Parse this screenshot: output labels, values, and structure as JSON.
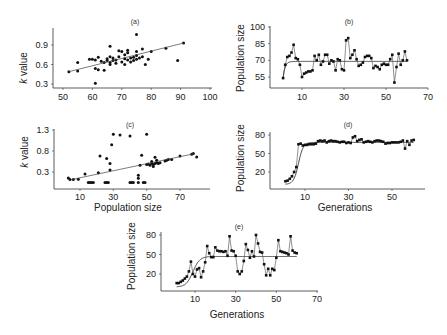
{
  "chart_data": [
    {
      "panel": "(a)",
      "type": "scatter",
      "title": "(a)",
      "xlabel": "",
      "ylabel": "k value",
      "xticks": [
        50,
        60,
        70,
        80,
        90,
        100
      ],
      "yticks": [
        0.3,
        0.6,
        0.9
      ],
      "xlim": [
        50,
        100
      ],
      "ylim": [
        0.25,
        1.1
      ],
      "points": [
        [
          52,
          0.49
        ],
        [
          55,
          0.5
        ],
        [
          55,
          0.63
        ],
        [
          59,
          0.68
        ],
        [
          60,
          0.68
        ],
        [
          61,
          0.67
        ],
        [
          61,
          0.54
        ],
        [
          62,
          0.52
        ],
        [
          61,
          0.31
        ],
        [
          62,
          0.71
        ],
        [
          63,
          0.65
        ],
        [
          64,
          0.51
        ],
        [
          64,
          0.63
        ],
        [
          65,
          0.66
        ],
        [
          65,
          0.69
        ],
        [
          66,
          0.72
        ],
        [
          66,
          0.6
        ],
        [
          66,
          0.63
        ],
        [
          66,
          0.88
        ],
        [
          67,
          0.66
        ],
        [
          67,
          0.7
        ],
        [
          68,
          0.62
        ],
        [
          68,
          0.67
        ],
        [
          69,
          0.72
        ],
        [
          69,
          0.81
        ],
        [
          70,
          0.8
        ],
        [
          70,
          0.64
        ],
        [
          71,
          0.6
        ],
        [
          71,
          0.69
        ],
        [
          71,
          0.75
        ],
        [
          72,
          0.67
        ],
        [
          72,
          0.78
        ],
        [
          72,
          0.82
        ],
        [
          73,
          0.7
        ],
        [
          73,
          0.64
        ],
        [
          74,
          0.66
        ],
        [
          74,
          0.71
        ],
        [
          75,
          0.74
        ],
        [
          75,
          0.68
        ],
        [
          75,
          0.8
        ],
        [
          75,
          1.06
        ],
        [
          76,
          0.7
        ],
        [
          77,
          0.84
        ],
        [
          77,
          0.72
        ],
        [
          78,
          0.6
        ],
        [
          79,
          0.68
        ],
        [
          80,
          0.8
        ],
        [
          85,
          0.85
        ],
        [
          89,
          0.66
        ],
        [
          91,
          0.93
        ]
      ],
      "fit": {
        "type": "linear",
        "from": [
          52,
          0.49
        ],
        "to": [
          91,
          0.93
        ]
      }
    },
    {
      "panel": "(b)",
      "type": "line",
      "title": "(b)",
      "xlabel": "",
      "ylabel": "Population size",
      "xticks": [
        10,
        30,
        50,
        70
      ],
      "yticks": [
        55,
        70,
        85,
        100
      ],
      "xlim": [
        0,
        70
      ],
      "ylim": [
        48,
        100
      ],
      "x": [
        1,
        2,
        3,
        4,
        5,
        6,
        7,
        8,
        9,
        10,
        11,
        12,
        13,
        14,
        15,
        16,
        17,
        18,
        19,
        20,
        21,
        22,
        23,
        24,
        25,
        26,
        27,
        28,
        29,
        30,
        31,
        32,
        33,
        34,
        35,
        36,
        37,
        38,
        39,
        40,
        41,
        42,
        43,
        44,
        45,
        46,
        47,
        48,
        49,
        50,
        51,
        52,
        53,
        54,
        55,
        56,
        57,
        58,
        59,
        60
      ],
      "values": [
        54,
        66,
        73,
        74,
        77,
        84,
        72,
        71,
        66,
        55,
        58,
        59,
        60,
        60,
        61,
        74,
        70,
        75,
        66,
        69,
        75,
        75,
        67,
        70,
        69,
        61,
        71,
        70,
        62,
        61,
        88,
        90,
        72,
        75,
        79,
        71,
        65,
        66,
        68,
        73,
        74,
        74,
        72,
        63,
        65,
        64,
        62,
        66,
        67,
        66,
        66,
        71,
        75,
        50,
        64,
        76,
        66,
        70,
        78,
        70
      ],
      "fit": {
        "type": "logistic",
        "asymptote": 69
      }
    },
    {
      "panel": "(c)",
      "type": "scatter",
      "title": "(c)",
      "xlabel": "Population size",
      "ylabel": "k value",
      "xticks": [
        10,
        30,
        50,
        70
      ],
      "yticks": [
        0.3,
        0.8,
        1.3
      ],
      "xlim": [
        0,
        85
      ],
      "ylim": [
        0,
        1.35
      ],
      "points": [
        [
          3,
          0.16
        ],
        [
          4,
          0.12
        ],
        [
          6,
          0.12
        ],
        [
          9,
          0.13
        ],
        [
          13,
          0.25
        ],
        [
          15,
          0.05
        ],
        [
          16,
          0.05
        ],
        [
          17,
          0.05
        ],
        [
          18,
          0.05
        ],
        [
          21,
          0.28
        ],
        [
          22,
          0.68
        ],
        [
          25,
          0.05
        ],
        [
          26,
          0.05
        ],
        [
          26,
          0.62
        ],
        [
          27,
          0.05
        ],
        [
          28,
          0.35
        ],
        [
          28,
          0.5
        ],
        [
          29,
          0.95
        ],
        [
          30,
          1.2
        ],
        [
          34,
          1.18
        ],
        [
          40,
          1.16
        ],
        [
          40,
          0.05
        ],
        [
          41,
          0.05
        ],
        [
          42,
          0.05
        ],
        [
          45,
          0.05
        ],
        [
          45,
          0.15
        ],
        [
          45,
          0.22
        ],
        [
          46,
          0.46
        ],
        [
          47,
          0.7
        ],
        [
          48,
          0.05
        ],
        [
          49,
          0.05
        ],
        [
          50,
          0.48
        ],
        [
          50,
          1.2
        ],
        [
          51,
          0.49
        ],
        [
          52,
          0.46
        ],
        [
          53,
          0.5
        ],
        [
          53,
          0.55
        ],
        [
          54,
          0.43
        ],
        [
          54,
          0.48
        ],
        [
          55,
          0.5
        ],
        [
          55,
          0.65
        ],
        [
          56,
          0.52
        ],
        [
          56,
          0.58
        ],
        [
          57,
          0.5
        ],
        [
          58,
          0.52
        ],
        [
          61,
          0.56
        ],
        [
          62,
          0.58
        ],
        [
          63,
          0.6
        ],
        [
          65,
          0.6
        ],
        [
          70,
          0.68
        ],
        [
          77,
          0.72
        ],
        [
          78,
          0.74
        ],
        [
          80,
          0.66
        ]
      ],
      "fit": {
        "type": "linear",
        "from": [
          5,
          0.12
        ],
        "to": [
          79,
          0.74
        ]
      }
    },
    {
      "panel": "(d)",
      "type": "line",
      "title": "(d)",
      "xlabel": "Generations",
      "ylabel": "Population size",
      "xticks": [
        10,
        30,
        50
      ],
      "yticks": [
        20,
        50,
        80
      ],
      "xlim": [
        0,
        70
      ],
      "ylim": [
        0,
        88
      ],
      "x": [
        1,
        2,
        3,
        4,
        5,
        6,
        7,
        8,
        9,
        10,
        11,
        12,
        13,
        14,
        15,
        16,
        17,
        18,
        19,
        20,
        21,
        22,
        23,
        24,
        25,
        26,
        27,
        28,
        29,
        30,
        31,
        32,
        33,
        34,
        35,
        36,
        37,
        38,
        39,
        40,
        41,
        42,
        43,
        44,
        45,
        46,
        47,
        48,
        49,
        50,
        51,
        52,
        53,
        54,
        55,
        56,
        57,
        58,
        59,
        60
      ],
      "values": [
        5,
        6,
        9,
        13,
        20,
        28,
        65,
        66,
        63,
        64,
        64,
        65,
        65,
        65,
        66,
        70,
        71,
        70,
        71,
        68,
        70,
        71,
        70,
        70,
        69,
        68,
        69,
        69,
        67,
        68,
        67,
        76,
        78,
        70,
        72,
        73,
        68,
        69,
        70,
        69,
        68,
        70,
        71,
        71,
        70,
        69,
        66,
        67,
        67,
        68,
        68,
        68,
        68,
        69,
        71,
        58,
        70,
        64,
        71,
        72
      ],
      "fit": {
        "type": "logistic",
        "asymptote": 68
      }
    },
    {
      "panel": "(e)",
      "type": "line",
      "title": "(e)",
      "xlabel": "Generations",
      "ylabel": "Population size",
      "xticks": [
        10,
        30,
        50,
        70
      ],
      "yticks": [
        20,
        50,
        80
      ],
      "xlim": [
        0,
        70
      ],
      "ylim": [
        0,
        88
      ],
      "x": [
        1,
        2,
        3,
        4,
        5,
        6,
        7,
        8,
        9,
        10,
        11,
        12,
        13,
        14,
        15,
        16,
        17,
        18,
        19,
        20,
        21,
        22,
        23,
        24,
        25,
        26,
        27,
        28,
        29,
        30,
        31,
        32,
        33,
        34,
        35,
        36,
        37,
        38,
        39,
        40,
        41,
        42,
        43,
        44,
        45,
        46,
        47,
        48,
        49,
        50,
        51,
        52,
        53,
        54,
        55,
        56,
        57,
        58,
        59,
        60
      ],
      "values": [
        6,
        6,
        8,
        10,
        13,
        16,
        24,
        39,
        20,
        16,
        27,
        29,
        15,
        24,
        38,
        63,
        52,
        46,
        46,
        61,
        56,
        55,
        55,
        54,
        55,
        48,
        78,
        56,
        55,
        48,
        24,
        20,
        24,
        40,
        66,
        57,
        45,
        55,
        47,
        80,
        67,
        54,
        53,
        35,
        18,
        28,
        18,
        28,
        26,
        45,
        72,
        55,
        54,
        53,
        52,
        50,
        78,
        56,
        53,
        52
      ],
      "fit": {
        "type": "logistic",
        "asymptote": 47
      }
    }
  ],
  "labels": {
    "a_title": "(a)",
    "b_title": "(b)",
    "c_title": "(c)",
    "d_title": "(d)",
    "e_title": "(e)",
    "ylabel_k": "k value",
    "ylabel_pop": "Population size",
    "xlabel_pop": "Population size",
    "xlabel_gen": "Generations"
  }
}
